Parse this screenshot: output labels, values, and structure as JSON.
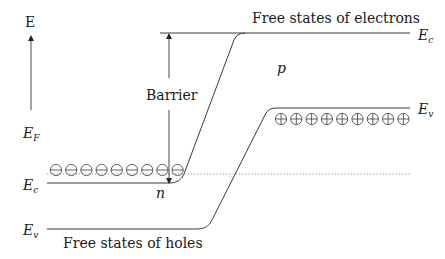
{
  "diagram": {
    "axis": {
      "label": "E"
    },
    "labels": {
      "free_electrons": "Free states of electrons",
      "free_holes": "Free states of holes",
      "barrier": "Barrier",
      "p_region": "p",
      "n_region": "n"
    },
    "levels": {
      "right_Ec": {
        "main": "E",
        "sub": "c"
      },
      "right_Ev": {
        "main": "E",
        "sub": "v"
      },
      "left_EF": {
        "main": "E",
        "sub": "F"
      },
      "left_Ec": {
        "main": "E",
        "sub": "c"
      },
      "left_Ev": {
        "main": "E",
        "sub": "v"
      }
    },
    "electrons": {
      "symbol": "⊖",
      "count": 9
    },
    "holes": {
      "symbol": "⊕",
      "count": 9
    },
    "colors": {
      "line": "#3a3a3a",
      "dotted": "#8a8a8a",
      "text": "#1a1a1a"
    }
  }
}
